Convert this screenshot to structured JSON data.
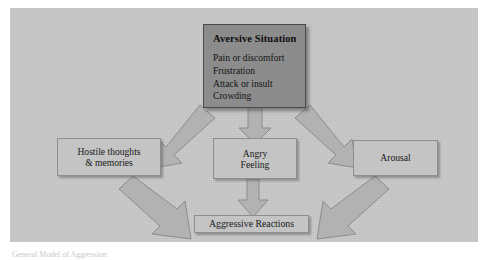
{
  "figure": {
    "background_color": "#c8c8c8",
    "page_color": "#ffffff",
    "caption": "General Model of Aggression"
  },
  "nodes": {
    "aversive": {
      "title": "Aversive Situation",
      "items": [
        "Pain or discomfort",
        "Frustration",
        "Attack or insult",
        "Crowding"
      ],
      "fill_color": "#8c8c8c"
    },
    "hostile": {
      "line1": "Hostile thoughts",
      "line2": "& memories",
      "fill_color": "#c4c4c4"
    },
    "angry": {
      "line1": "Angry",
      "line2": "Feeling",
      "fill_color": "#c4c4c4"
    },
    "arousal": {
      "line1": "Arousal",
      "fill_color": "#c4c4c4"
    },
    "aggressive": {
      "line1": "Aggressive Reactions",
      "fill_color": "#c4c4c4"
    }
  },
  "arrows": {
    "fill_color": "#b4b4b4",
    "edge_color": "#8a8a8a",
    "items": [
      {
        "name": "arrow-aversive-to-hostile",
        "direction": "down-left"
      },
      {
        "name": "arrow-aversive-to-angry",
        "direction": "down"
      },
      {
        "name": "arrow-aversive-to-arousal",
        "direction": "down-right"
      },
      {
        "name": "arrow-hostile-to-aggressive",
        "direction": "down-right"
      },
      {
        "name": "arrow-angry-to-aggressive",
        "direction": "down"
      },
      {
        "name": "arrow-arousal-to-aggressive",
        "direction": "down-left"
      }
    ]
  }
}
